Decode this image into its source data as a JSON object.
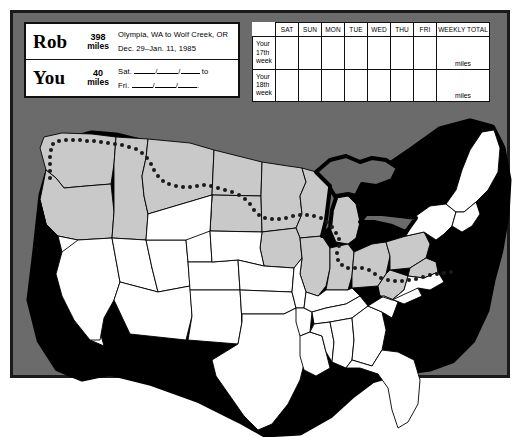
{
  "page": {
    "background_color": "#6b6b6b",
    "panel_border_color": "#1a1a1a",
    "map_traversed_color": "#c9c9c9",
    "map_untraversed_color": "#ffffff",
    "map_outline_color": "#000000",
    "route_dot_color": "#1a1a1a"
  },
  "info_box": {
    "rob": {
      "name": "Rob",
      "distance_value": "398",
      "distance_unit": "miles",
      "route": "Olympia, WA to Wolf Creek, OR",
      "dates": "Dec. 29–Jan. 11, 1985"
    },
    "you": {
      "name": "You",
      "distance_value": "40",
      "distance_unit": "miles",
      "from_label": "Sat.",
      "to_word": "to",
      "until_label": "Fri.",
      "slash": "/",
      "period": "."
    }
  },
  "log_table": {
    "day_headers": [
      "SAT",
      "SUN",
      "MON",
      "TUE",
      "WED",
      "THU",
      "FRI"
    ],
    "total_header": "WEEKLY TOTAL",
    "rows": [
      {
        "label": "Your\n17th\nweek",
        "label_lines": [
          "Your",
          "17th",
          "week"
        ],
        "total_unit": "miles",
        "day_values": [
          "",
          "",
          "",
          "",
          "",
          "",
          ""
        ]
      },
      {
        "label": "Your\n18th\nweek",
        "label_lines": [
          "Your",
          "18th",
          "week"
        ],
        "total_unit": "miles",
        "day_values": [
          "",
          "",
          "",
          "",
          "",
          "",
          ""
        ]
      }
    ]
  },
  "map": {
    "title": "united-states-map",
    "description": "Map of the contiguous United States with a dotted cross-country route across the northern states from the Pacific Northwest to the Mid-Atlantic; traversed states shaded gray.",
    "route_start_region": "Pacific Northwest",
    "route_end_region": "Mid-Atlantic"
  }
}
